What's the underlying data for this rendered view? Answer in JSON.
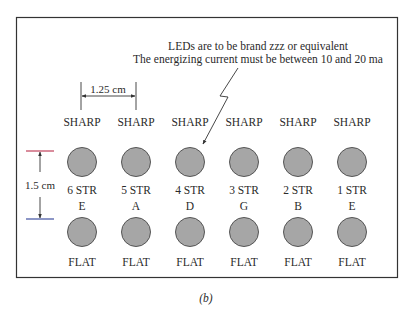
{
  "note": {
    "line1": "LEDs are to be brand zzz or equivalent",
    "line2": "The energizing current must be between 10 and 20 ma"
  },
  "dimensions": {
    "horizontal": "1.25 cm",
    "vertical": "1.5 cm"
  },
  "columns": [
    {
      "top": "SHARP",
      "string": "6 STR",
      "note": "E",
      "bottom": "FLAT"
    },
    {
      "top": "SHARP",
      "string": "5 STR",
      "note": "A",
      "bottom": "FLAT"
    },
    {
      "top": "SHARP",
      "string": "4 STR",
      "note": "D",
      "bottom": "FLAT"
    },
    {
      "top": "SHARP",
      "string": "3 STR",
      "note": "G",
      "bottom": "FLAT"
    },
    {
      "top": "SHARP",
      "string": "2 STR",
      "note": "B",
      "bottom": "FLAT"
    },
    {
      "top": "SHARP",
      "string": "1 STR",
      "note": "E",
      "bottom": "FLAT"
    }
  ],
  "caption": "(b)",
  "colors": {
    "led_fill": "#a6a6a6",
    "led_stroke": "#555555",
    "top_marker": "#c0405a",
    "bottom_marker": "#4050a0",
    "frame": "#333333"
  }
}
